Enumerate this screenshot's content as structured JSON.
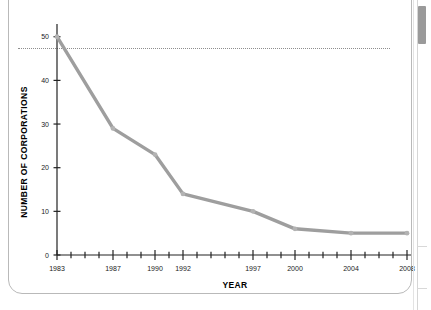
{
  "document": {
    "page_background": "#ffffff",
    "card_border_color": "#b9b9b9"
  },
  "scrollbar": {
    "name": "vertical-scrollbar",
    "thumb_color": "#9a9a9a",
    "track_color": "#ffffff"
  },
  "chart_data": {
    "type": "line",
    "title": "",
    "xlabel": "YEAR",
    "ylabel": "NUMBER OF CORPORATIONS",
    "x": [
      1983,
      1987,
      1990,
      1992,
      1997,
      2000,
      2004,
      2008
    ],
    "values": [
      50,
      29,
      23,
      14,
      10,
      6,
      5,
      5
    ],
    "series": [
      {
        "name": "Number of corporations",
        "x": [
          1983,
          1987,
          1990,
          1992,
          1997,
          2000,
          2004,
          2008
        ],
        "values": [
          50,
          29,
          23,
          14,
          10,
          6,
          5,
          5
        ],
        "color": "#9e9e9e"
      }
    ],
    "xlim": [
      1983,
      2008
    ],
    "ylim": [
      0,
      52
    ],
    "x_tick_labels": [
      "1983",
      "1987",
      "1990",
      "1992",
      "1997",
      "2000",
      "2004",
      "2008"
    ],
    "x_labeled_values": [
      1983,
      1987,
      1990,
      1992,
      1997,
      2000,
      2004,
      2008
    ],
    "x_minor_ticks": [
      1984,
      1985,
      1986,
      1988,
      1989,
      1991,
      1993,
      1994,
      1995,
      1996,
      1998,
      1999,
      2001,
      2002,
      2003,
      2005,
      2006,
      2007
    ],
    "y_tick_labels": [
      "0",
      "10",
      "20",
      "30",
      "40",
      "50"
    ],
    "y_tick_values": [
      0,
      10,
      20,
      30,
      40,
      50
    ],
    "grid": false,
    "legend": null,
    "legend_position": "none",
    "line_color": "#9e9e9e",
    "axis_color": "#222222"
  }
}
